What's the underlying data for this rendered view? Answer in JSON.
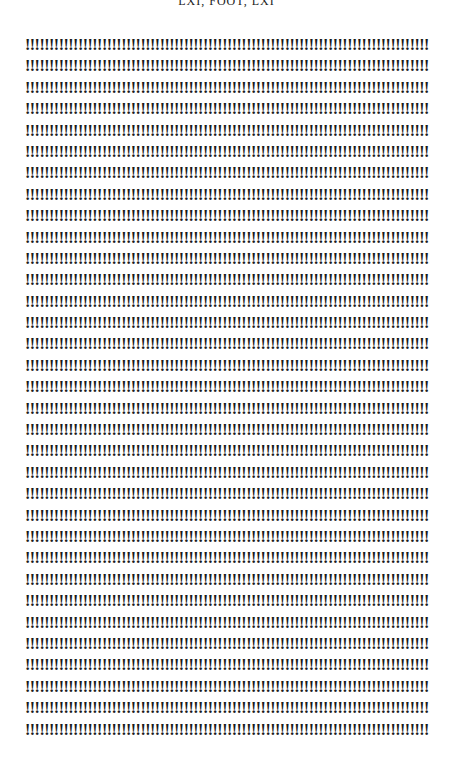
{
  "page": {
    "header": "LXI, FOOT, LXI",
    "line_text": "!!!!!!!!!!!!!!!!!!!!!!!!!!!!!!!!!!!!!!!!!!!!!!!!!!!!!!!!!!!!!!!!!!!!!!!!!!!!!!!!!!!!!!",
    "line_count": 33
  }
}
